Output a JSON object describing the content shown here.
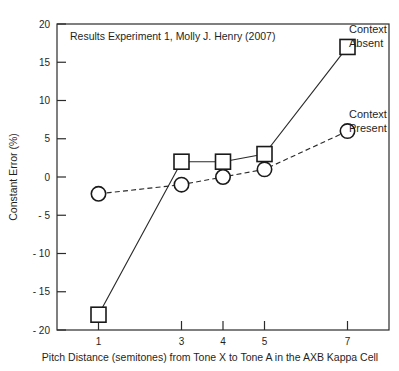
{
  "chart_data": {
    "type": "line",
    "title": "Results Experiment 1, Molly J. Henry (2007)",
    "xlabel": "Pitch Distance (semitones) from Tone  X  to Tone A  in the AXB Kappa Cell",
    "ylabel": "Constant Error (%)",
    "x": [
      1,
      3,
      4,
      5,
      7
    ],
    "xtick_labels": [
      "1",
      "3",
      "4",
      "5",
      "7"
    ],
    "ytick_labels": [
      "20",
      "15",
      "10",
      "5",
      "0",
      "- 5",
      "- 10",
      "- 15",
      "- 20"
    ],
    "ytick_values": [
      20,
      15,
      10,
      5,
      0,
      -5,
      -10,
      -15,
      -20
    ],
    "xlim": [
      0,
      8
    ],
    "ylim": [
      -20,
      20
    ],
    "grid": false,
    "legend_position": "right-outside",
    "series": [
      {
        "name": "Context Absent",
        "legend_line1": "Context",
        "legend_line2": "Absent",
        "marker": "square",
        "linestyle": "solid",
        "values": [
          -18,
          2,
          2,
          3,
          17
        ]
      },
      {
        "name": "Context Present",
        "legend_line1": "Context",
        "legend_line2": "Present",
        "marker": "circle",
        "linestyle": "dashed",
        "values": [
          -2.2,
          -1,
          0,
          1,
          6
        ]
      }
    ]
  },
  "colors": {
    "ink": "#1a1a1a",
    "axis": "#2b2b2b",
    "background": "#ffffff"
  }
}
